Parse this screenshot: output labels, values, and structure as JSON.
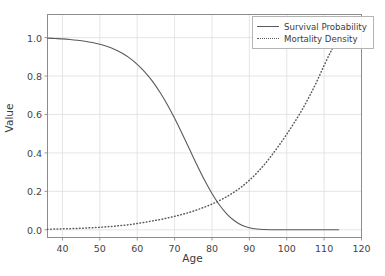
{
  "chart_data": {
    "type": "line",
    "title": "",
    "xlabel": "Age",
    "ylabel": "Value",
    "xlim": [
      36,
      120
    ],
    "ylim": [
      -0.04,
      1.12
    ],
    "xticks": [
      40,
      50,
      60,
      70,
      80,
      90,
      100,
      110,
      120
    ],
    "yticks": [
      "0.0",
      "0.2",
      "0.4",
      "0.6",
      "0.8",
      "1.0"
    ],
    "grid": true,
    "legend_position": "upper right",
    "series": [
      {
        "name": "Survival Probability",
        "style": "solid",
        "color": "#5a5a5a",
        "x": [
          36,
          38,
          40,
          42,
          44,
          46,
          48,
          50,
          52,
          54,
          56,
          58,
          60,
          62,
          64,
          66,
          68,
          70,
          72,
          74,
          76,
          78,
          80,
          82,
          84,
          86,
          88,
          90,
          92,
          94,
          96,
          98,
          100,
          102,
          104,
          106,
          108,
          110,
          112,
          114
        ],
        "y": [
          0.997,
          0.995,
          0.993,
          0.99,
          0.986,
          0.981,
          0.974,
          0.965,
          0.953,
          0.938,
          0.918,
          0.893,
          0.861,
          0.822,
          0.775,
          0.718,
          0.653,
          0.58,
          0.501,
          0.419,
          0.337,
          0.259,
          0.189,
          0.129,
          0.082,
          0.047,
          0.024,
          0.011,
          0.004,
          0.0013,
          0.0004,
          0.0001,
          2e-05,
          0.0,
          0.0,
          0.0,
          0.0,
          0.0,
          0.0,
          0.0
        ]
      },
      {
        "name": "Mortality Density",
        "style": "dotted",
        "color": "#5a5a5a",
        "x": [
          36,
          38,
          40,
          42,
          44,
          46,
          48,
          50,
          52,
          54,
          56,
          58,
          60,
          62,
          64,
          66,
          68,
          70,
          72,
          74,
          76,
          78,
          80,
          82,
          84,
          86,
          88,
          90,
          92,
          94,
          96,
          98,
          100,
          102,
          104,
          106,
          108,
          110,
          112,
          114
        ],
        "y": [
          0.003,
          0.004,
          0.005,
          0.006,
          0.007,
          0.009,
          0.011,
          0.013,
          0.016,
          0.019,
          0.023,
          0.027,
          0.033,
          0.039,
          0.046,
          0.053,
          0.061,
          0.07,
          0.08,
          0.091,
          0.104,
          0.118,
          0.134,
          0.152,
          0.173,
          0.197,
          0.225,
          0.258,
          0.296,
          0.339,
          0.388,
          0.441,
          0.497,
          0.557,
          0.621,
          0.692,
          0.77,
          0.855,
          0.935,
          1.0
        ]
      }
    ]
  },
  "legend": {
    "items": [
      {
        "label": "Survival Probability",
        "style": "solid"
      },
      {
        "label": "Mortality Density",
        "style": "dotted"
      }
    ]
  }
}
